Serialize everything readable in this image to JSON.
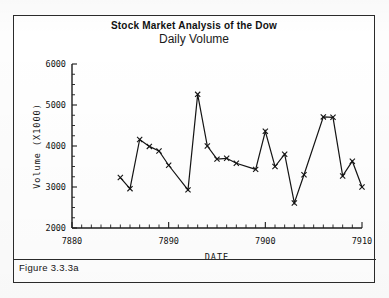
{
  "figure": {
    "caption": "Figure 3.3.3a",
    "frame_color": "#2b2b2b",
    "background_color": "#ffffff"
  },
  "chart_data": {
    "type": "line",
    "title": "Stock Market Analysis of the Dow",
    "subtitle": "Daily Volume",
    "xlabel": "DATE",
    "ylabel": "Volume (X1000)",
    "xlim": [
      7880,
      7910
    ],
    "ylim": [
      2000,
      6000
    ],
    "xticks": [
      7880,
      7890,
      7900,
      7910
    ],
    "xtick_labels": [
      "7880",
      "7890",
      "7900",
      "7910"
    ],
    "xminor_tick_step": 1,
    "yticks": [
      2000,
      3000,
      4000,
      5000,
      6000
    ],
    "ytick_labels": [
      "2000",
      "3000",
      "4000",
      "5000",
      "6000"
    ],
    "grid": false,
    "legend": null,
    "marker": "x",
    "line_color": "#141414",
    "x": [
      7885,
      7886,
      7887,
      7888,
      7889,
      7890,
      7892,
      7893,
      7894,
      7895,
      7896,
      7897,
      7899,
      7900,
      7901,
      7902,
      7903,
      7904,
      7906,
      7907,
      7908,
      7909,
      7910
    ],
    "values": [
      3230,
      2960,
      4160,
      3990,
      3880,
      3530,
      2930,
      5260,
      4000,
      3680,
      3700,
      3580,
      3430,
      4360,
      3500,
      3800,
      2610,
      3300,
      4710,
      4700,
      3270,
      3630,
      3000
    ],
    "series": [
      {
        "name": "Daily Volume",
        "values": [
          3230,
          2960,
          4160,
          3990,
          3880,
          3530,
          2930,
          5260,
          4000,
          3680,
          3700,
          3580,
          3430,
          4360,
          3500,
          3800,
          2610,
          3300,
          4710,
          4700,
          3270,
          3630,
          3000
        ]
      }
    ]
  }
}
